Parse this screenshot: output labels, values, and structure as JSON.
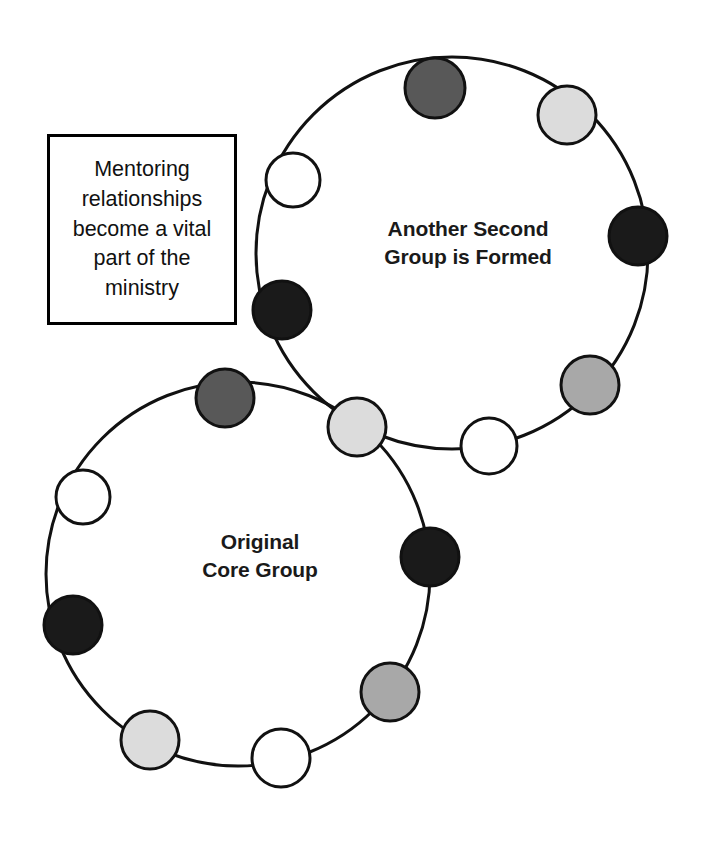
{
  "page": {
    "background": "#ffffff",
    "width": 703,
    "height": 842
  },
  "caption": {
    "text": "Mentoring\nrelationships\nbecome a vital\npart of the\nministry",
    "box": {
      "x": 47,
      "y": 134,
      "width": 190,
      "height": 191
    },
    "border_color": "#000000",
    "fill_color": "#ffffff"
  },
  "groups": [
    {
      "id": "second-group",
      "label": "Another Second\nGroup is Formed",
      "label_x": 360,
      "label_y": 215,
      "label_width": 216,
      "circle": {
        "cx": 452,
        "cy": 253,
        "r": 196
      },
      "stroke": "#111111",
      "stroke_width": 3
    },
    {
      "id": "core-group",
      "label": "Original\nCore Group",
      "label_x": 165,
      "label_y": 528,
      "label_width": 190,
      "circle": {
        "cx": 238,
        "cy": 574,
        "r": 192
      },
      "stroke": "#111111",
      "stroke_width": 3
    }
  ],
  "palette": {
    "white": "#ffffff",
    "light_gray": "#dcdcdc",
    "medium_gray": "#a8a8a8",
    "dark_gray": "#585858",
    "black": "#1a1a1a",
    "outline": "#111111"
  },
  "nodes": [
    {
      "name": "second-group-member-top",
      "group": "second-group",
      "cx": 435,
      "cy": 88,
      "r": 30,
      "fill": "#585858"
    },
    {
      "name": "second-group-member-upper-right",
      "group": "second-group",
      "cx": 567,
      "cy": 115,
      "r": 29,
      "fill": "#dcdcdc"
    },
    {
      "name": "second-group-member-right",
      "group": "second-group",
      "cx": 638,
      "cy": 236,
      "r": 29,
      "fill": "#1a1a1a"
    },
    {
      "name": "second-group-member-lower-right",
      "group": "second-group",
      "cx": 590,
      "cy": 385,
      "r": 29,
      "fill": "#a8a8a8"
    },
    {
      "name": "second-group-member-bottom",
      "group": "second-group",
      "cx": 489,
      "cy": 446,
      "r": 28,
      "fill": "#ffffff"
    },
    {
      "name": "second-group-member-lower-left",
      "group": "second-group",
      "cx": 282,
      "cy": 310,
      "r": 29,
      "fill": "#1a1a1a"
    },
    {
      "name": "second-group-member-left",
      "group": "second-group",
      "cx": 293,
      "cy": 180,
      "r": 27,
      "fill": "#ffffff"
    },
    {
      "name": "core-group-member-upper-left",
      "group": "core-group",
      "cx": 225,
      "cy": 398,
      "r": 29,
      "fill": "#585858"
    },
    {
      "name": "core-group-member-left",
      "group": "core-group",
      "cx": 83,
      "cy": 497,
      "r": 27,
      "fill": "#ffffff"
    },
    {
      "name": "core-group-member-lower-left",
      "group": "core-group",
      "cx": 73,
      "cy": 625,
      "r": 29,
      "fill": "#1a1a1a"
    },
    {
      "name": "core-group-member-bottom-left",
      "group": "core-group",
      "cx": 150,
      "cy": 740,
      "r": 29,
      "fill": "#dcdcdc"
    },
    {
      "name": "core-group-member-bottom",
      "group": "core-group",
      "cx": 281,
      "cy": 758,
      "r": 29,
      "fill": "#ffffff"
    },
    {
      "name": "core-group-member-bottom-right",
      "group": "core-group",
      "cx": 390,
      "cy": 692,
      "r": 29,
      "fill": "#a8a8a8"
    },
    {
      "name": "core-group-member-right",
      "group": "core-group",
      "cx": 430,
      "cy": 557,
      "r": 29,
      "fill": "#1a1a1a"
    },
    {
      "name": "shared-bridge-member",
      "group": "both",
      "cx": 357,
      "cy": 427,
      "r": 29,
      "fill": "#dcdcdc"
    }
  ]
}
